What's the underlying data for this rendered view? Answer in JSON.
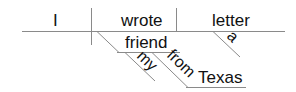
{
  "diagram": {
    "type": "reed-kellogg-sentence-diagram",
    "sentence": "I wrote a letter to my friend from Texas",
    "words": {
      "subject": "I",
      "verb": "wrote",
      "direct_object": "letter",
      "object_modifier": "a",
      "indirect_object": "friend",
      "indirect_modifier_1": "my",
      "preposition": "from",
      "prepositional_object": "Texas"
    },
    "colors": {
      "line": "#888888",
      "text": "#111111",
      "background": "#ffffff"
    }
  }
}
